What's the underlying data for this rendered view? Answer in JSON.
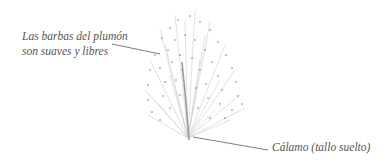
{
  "diagram": {
    "labels": {
      "barbs_line1": "Las barbas del plumón",
      "barbs_line2": "son suaves y libres",
      "calamo": "Cálamo (tallo suelto)"
    },
    "colors": {
      "background": "#ffffff",
      "text": "#555555",
      "leader_line": "#444444",
      "feather": "#b8b8b8",
      "speckle": "#666666"
    }
  }
}
